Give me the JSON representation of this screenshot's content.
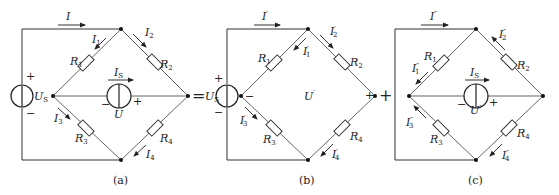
{
  "figure": {
    "operators": {
      "equals": "=",
      "plus": "+"
    },
    "colors": {
      "line": "#333333",
      "background": "#ffffff"
    }
  },
  "panels": [
    {
      "id": "a",
      "caption": "(a)",
      "sources": {
        "voltage": {
          "name": "U",
          "sub": "S",
          "plus": "+",
          "minus": "−"
        },
        "current": {
          "name": "I",
          "sub": "S",
          "plus": "+",
          "minus": "−",
          "voltage_label": "U"
        }
      },
      "resistors": [
        {
          "name": "R",
          "sub": "1"
        },
        {
          "name": "R",
          "sub": "2"
        },
        {
          "name": "R",
          "sub": "3"
        },
        {
          "name": "R",
          "sub": "4"
        }
      ],
      "currents": {
        "I": {
          "name": "I",
          "sub": "",
          "prime": ""
        },
        "I1": {
          "name": "I",
          "sub": "1",
          "prime": ""
        },
        "I2": {
          "name": "I",
          "sub": "2",
          "prime": ""
        },
        "I3": {
          "name": "I",
          "sub": "3",
          "prime": ""
        },
        "I4": {
          "name": "I",
          "sub": "4",
          "prime": ""
        }
      }
    },
    {
      "id": "b",
      "caption": "(b)",
      "sources": {
        "voltage": {
          "name": "U",
          "sub": "S",
          "plus": "+",
          "minus": "−"
        }
      },
      "open_circuit": {
        "name": "U",
        "prime": "′",
        "plus": "+",
        "minus": "−"
      },
      "resistors": [
        {
          "name": "R",
          "sub": "1"
        },
        {
          "name": "R",
          "sub": "2"
        },
        {
          "name": "R",
          "sub": "3"
        },
        {
          "name": "R",
          "sub": "4"
        }
      ],
      "currents": {
        "I": {
          "name": "I",
          "sub": "",
          "prime": "′"
        },
        "I1": {
          "name": "I",
          "sub": "1",
          "prime": "′"
        },
        "I2": {
          "name": "I",
          "sub": "2",
          "prime": "′"
        },
        "I3": {
          "name": "I",
          "sub": "3",
          "prime": "′"
        },
        "I4": {
          "name": "I",
          "sub": "4",
          "prime": "′"
        }
      }
    },
    {
      "id": "c",
      "caption": "(c)",
      "sources": {
        "current": {
          "name": "I",
          "sub": "S",
          "plus": "+",
          "minus": "−",
          "voltage_label": "U",
          "voltage_prime": "″"
        }
      },
      "resistors": [
        {
          "name": "R",
          "sub": "1"
        },
        {
          "name": "R",
          "sub": "2"
        },
        {
          "name": "R",
          "sub": "3"
        },
        {
          "name": "R",
          "sub": "4"
        }
      ],
      "currents": {
        "I": {
          "name": "I",
          "sub": "",
          "prime": "″"
        },
        "I1": {
          "name": "I",
          "sub": "1",
          "prime": "″"
        },
        "I2": {
          "name": "I",
          "sub": "2",
          "prime": "″"
        },
        "I3": {
          "name": "I",
          "sub": "3",
          "prime": "″"
        },
        "I4": {
          "name": "I",
          "sub": "4",
          "prime": "″"
        }
      }
    }
  ]
}
